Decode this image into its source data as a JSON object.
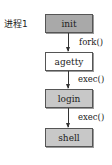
{
  "diagram": {
    "process_label": "进程1",
    "nodes": [
      {
        "id": "init",
        "label": "init",
        "fill": "#a9a9a9"
      },
      {
        "id": "agetty",
        "label": "agetty",
        "fill": "#ffffff"
      },
      {
        "id": "login",
        "label": "login",
        "fill": "#c8c8c8"
      },
      {
        "id": "shell",
        "label": "shell",
        "fill": "#c8c8c8"
      }
    ],
    "edges": [
      {
        "from": "init",
        "to": "agetty",
        "label": "fork()"
      },
      {
        "from": "agetty",
        "to": "login",
        "label": "exec()"
      },
      {
        "from": "login",
        "to": "shell",
        "label": "exec()"
      }
    ]
  }
}
